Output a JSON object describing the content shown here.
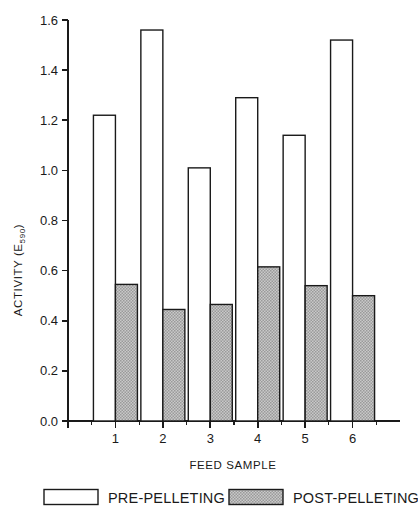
{
  "chart_data": {
    "type": "bar",
    "title": "",
    "subtitle": "",
    "xlabel": "FEED SAMPLE",
    "ylabel": "ACTIVITY (E",
    "ylabel_sub": "590",
    "ylabel_close": ")",
    "categories": [
      "1",
      "2",
      "3",
      "4",
      "5",
      "6"
    ],
    "series": [
      {
        "name": "PRE-PELLETING",
        "values": [
          1.22,
          1.56,
          1.01,
          1.29,
          1.14,
          1.52
        ],
        "fill": "#ffffff",
        "stroke": "#1a1a1a"
      },
      {
        "name": "POST-PELLETING",
        "values": [
          0.545,
          0.445,
          0.465,
          0.615,
          0.54,
          0.5
        ],
        "fill": "#b9b9b9",
        "stroke": "#1a1a1a"
      }
    ],
    "ylim": [
      0.0,
      1.6
    ],
    "ytick_labels": [
      "0.0",
      "0.2",
      "0.4",
      "0.6",
      "0.8",
      "1.0",
      "1.2",
      "1.4",
      "1.6"
    ],
    "ytick_values": [
      0.0,
      0.2,
      0.4,
      0.6,
      0.8,
      1.0,
      1.2,
      1.4,
      1.6
    ],
    "xtick_labels": [
      "1",
      "2",
      "3",
      "4",
      "5",
      "6"
    ],
    "grid": false,
    "legend_position": "bottom"
  },
  "legend": {
    "entries": [
      {
        "label": "PRE-PELLETING"
      },
      {
        "label": "POST-PELLETING"
      }
    ]
  }
}
